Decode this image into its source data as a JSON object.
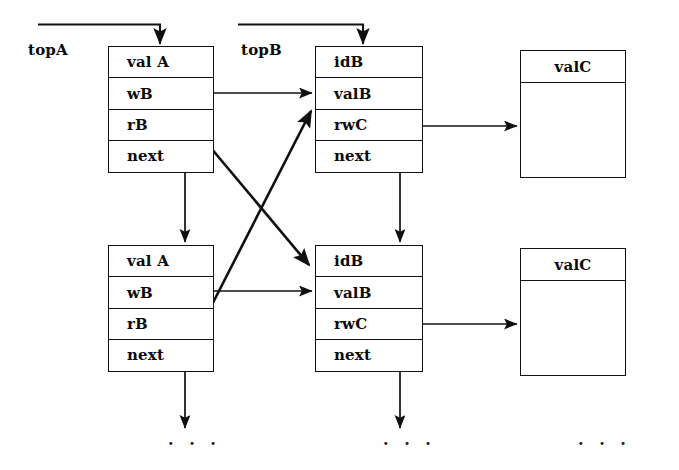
{
  "diagram": {
    "background_color": "#fefefe",
    "line_color": "#101010",
    "text_color": "#0b0b0b",
    "pointer_labels": [
      {
        "name": "topA",
        "text": "topA"
      },
      {
        "name": "topB",
        "text": "topB"
      }
    ],
    "a_nodes": [
      {
        "name": "a-node-top",
        "rows": [
          {
            "field": "val A"
          },
          {
            "field": "wB"
          },
          {
            "field": "rB"
          },
          {
            "field": "next"
          }
        ]
      },
      {
        "name": "a-node-bottom",
        "rows": [
          {
            "field": "val A"
          },
          {
            "field": "wB"
          },
          {
            "field": "rB"
          },
          {
            "field": "next"
          }
        ]
      }
    ],
    "b_nodes": [
      {
        "name": "b-node-top",
        "rows": [
          {
            "field": "idB"
          },
          {
            "field": "valB"
          },
          {
            "field": "rwC"
          },
          {
            "field": "next"
          }
        ]
      },
      {
        "name": "b-node-bottom",
        "rows": [
          {
            "field": "idB"
          },
          {
            "field": "valB"
          },
          {
            "field": "rwC"
          },
          {
            "field": "next"
          }
        ]
      }
    ],
    "c_nodes": [
      {
        "name": "c-node-top",
        "header": "valC",
        "body": ""
      },
      {
        "name": "c-node-bottom",
        "header": "valC",
        "body": ""
      }
    ],
    "continuation_marks": [
      {
        "name": "ellipsis-a",
        "text": "·  ·  ·"
      },
      {
        "name": "ellipsis-b",
        "text": "·  ·  ·"
      },
      {
        "name": "ellipsis-c",
        "text": "·  ·  ·"
      }
    ]
  }
}
